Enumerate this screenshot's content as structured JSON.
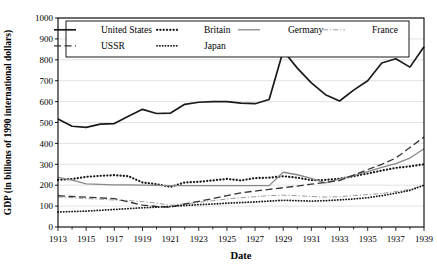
{
  "chart_data": {
    "type": "line",
    "title": "",
    "xlabel": "Date",
    "ylabel": "GDP (in billions of 1990 international dollars)",
    "xlim": [
      1913,
      1939
    ],
    "ylim": [
      0,
      1000
    ],
    "ytick_step": 100,
    "yticks": [
      "0",
      "100",
      "200",
      "300",
      "400",
      "500",
      "600",
      "700",
      "800",
      "900",
      "1000"
    ],
    "xticks": [
      "1913",
      "1915",
      "1917",
      "1919",
      "1921",
      "1923",
      "1925",
      "1927",
      "1929",
      "1931",
      "1933",
      "1935",
      "1937",
      "1939"
    ],
    "xticks_all_years": [
      1913,
      1914,
      1915,
      1916,
      1917,
      1918,
      1919,
      1920,
      1921,
      1922,
      1923,
      1924,
      1925,
      1926,
      1927,
      1928,
      1929,
      1930,
      1931,
      1932,
      1933,
      1934,
      1935,
      1936,
      1937,
      1938,
      1939
    ],
    "grid": "horizontal",
    "legend_position": "top-inside",
    "x": [
      1913,
      1914,
      1915,
      1916,
      1917,
      1918,
      1919,
      1920,
      1921,
      1922,
      1923,
      1924,
      1925,
      1926,
      1927,
      1928,
      1929,
      1930,
      1931,
      1932,
      1933,
      1934,
      1935,
      1936,
      1937,
      1938,
      1939
    ],
    "series": [
      {
        "name": "United States",
        "style": "solid-thick",
        "color": "#1a1a1a",
        "values": [
          517,
          482,
          477,
          492,
          495,
          530,
          563,
          543,
          545,
          587,
          597,
          600,
          600,
          593,
          590,
          610,
          843,
          760,
          690,
          633,
          603,
          655,
          700,
          785,
          805,
          765,
          862
        ]
      },
      {
        "name": "Britain",
        "style": "dotted-thick",
        "color": "#1a1a1a",
        "values": [
          225,
          230,
          240,
          245,
          248,
          243,
          213,
          205,
          192,
          213,
          216,
          223,
          230,
          223,
          234,
          236,
          243,
          236,
          224,
          225,
          231,
          243,
          256,
          270,
          283,
          290,
          300
        ]
      },
      {
        "name": "Germany",
        "style": "solid-gray",
        "color": "#888888",
        "values": [
          237,
          224,
          206,
          204,
          202,
          202,
          200,
          199,
          198,
          198,
          198,
          198,
          198,
          198,
          198,
          198,
          262,
          250,
          233,
          211,
          229,
          247,
          265,
          285,
          303,
          330,
          374
        ]
      },
      {
        "name": "France",
        "style": "dash-dot",
        "color": "#9a9a9a",
        "values": [
          144,
          140,
          136,
          133,
          129,
          126,
          122,
          114,
          104,
          110,
          118,
          126,
          134,
          140,
          145,
          150,
          152,
          150,
          146,
          143,
          145,
          150,
          155,
          160,
          170,
          180,
          200
        ]
      },
      {
        "name": "USSR",
        "style": "long-dash",
        "color": "#333333",
        "values": [
          150,
          146,
          143,
          139,
          136,
          120,
          105,
          98,
          95,
          110,
          123,
          136,
          150,
          163,
          172,
          180,
          188,
          196,
          205,
          213,
          222,
          248,
          275,
          300,
          330,
          380,
          430
        ]
      },
      {
        "name": "Japan",
        "style": "dotted-fine",
        "color": "#1a1a1a",
        "values": [
          72,
          74,
          76,
          80,
          84,
          88,
          92,
          95,
          98,
          103,
          107,
          110,
          114,
          117,
          120,
          124,
          128,
          126,
          124,
          126,
          130,
          134,
          140,
          150,
          162,
          175,
          200
        ]
      }
    ]
  },
  "axis": {
    "y_title": "GDP (in billions of 1990 international dollars)",
    "x_title": "Date"
  },
  "legend": {
    "items": [
      {
        "label": "United States",
        "style": "solid-thick"
      },
      {
        "label": "Britain",
        "style": "dotted-thick"
      },
      {
        "label": "Germany",
        "style": "solid-gray"
      },
      {
        "label": "France",
        "style": "dash-dot"
      },
      {
        "label": "USSR",
        "style": "long-dash"
      },
      {
        "label": "Japan",
        "style": "dotted-fine"
      }
    ]
  }
}
